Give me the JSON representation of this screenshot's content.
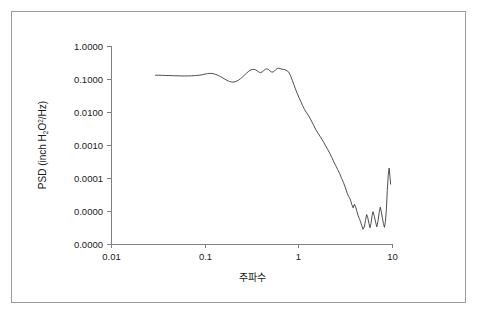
{
  "figure": {
    "background_color": "#ffffff",
    "border_color": "#9a9a9a"
  },
  "chart_data": {
    "type": "line",
    "title": "",
    "xlabel": "주파수",
    "ylabel": "PSD (inch H2O2/Hz)",
    "ylabel_parts": {
      "prefix": "PSD (inch H",
      "sub": "2",
      "mid": "O",
      "sup": "2",
      "suffix": "/Hz)"
    },
    "xscale": "log",
    "yscale": "log",
    "xlim": [
      0.01,
      10
    ],
    "ylim": [
      1e-06,
      1.0
    ],
    "grid": false,
    "legend": null,
    "xtick_labels": [
      "0.01",
      "0.1",
      "1",
      "10"
    ],
    "xtick_values": [
      0.01,
      0.1,
      1,
      10
    ],
    "ytick_labels": [
      "1.0000",
      "0.1000",
      "0.0100",
      "0.0010",
      "0.0001",
      "0.0000",
      "0.0000"
    ],
    "ytick_values": [
      1.0,
      0.1,
      0.01,
      0.001,
      0.0001,
      1e-05,
      1e-06
    ],
    "line_color": "#3b3b3b",
    "series": [
      {
        "name": "PSD",
        "x": [
          0.0295,
          0.032,
          0.035,
          0.038,
          0.042,
          0.046,
          0.05,
          0.055,
          0.06,
          0.066,
          0.072,
          0.079,
          0.086,
          0.094,
          0.1,
          0.106,
          0.112,
          0.118,
          0.124,
          0.13,
          0.138,
          0.146,
          0.154,
          0.163,
          0.172,
          0.182,
          0.192,
          0.203,
          0.214,
          0.226,
          0.238,
          0.25,
          0.262,
          0.275,
          0.288,
          0.3,
          0.315,
          0.33,
          0.345,
          0.36,
          0.375,
          0.39,
          0.405,
          0.42,
          0.437,
          0.455,
          0.472,
          0.49,
          0.51,
          0.53,
          0.55,
          0.57,
          0.59,
          0.61,
          0.63,
          0.655,
          0.68,
          0.705,
          0.73,
          0.76,
          0.79,
          0.82,
          0.85,
          0.885,
          0.92,
          0.96,
          1.0,
          1.05,
          1.1,
          1.15,
          1.2,
          1.26,
          1.32,
          1.38,
          1.45,
          1.52,
          1.6,
          1.68,
          1.76,
          1.85,
          1.94,
          2.04,
          2.14,
          2.25,
          2.36,
          2.48,
          2.6,
          2.73,
          2.86,
          3.0,
          3.1,
          3.2,
          3.3,
          3.42,
          3.55,
          3.68,
          3.8,
          3.92,
          4.05,
          4.18,
          4.3,
          4.42,
          4.55,
          4.7,
          4.85,
          5.0,
          5.15,
          5.3,
          5.45,
          5.6,
          5.75,
          5.9,
          6.05,
          6.2,
          6.4,
          6.6,
          6.8,
          7.0,
          7.2,
          7.4,
          7.6,
          7.8,
          8.0,
          8.2,
          8.4,
          8.6,
          8.8,
          9.0,
          9.2,
          9.4,
          9.55
        ],
        "y": [
          0.13,
          0.13,
          0.129,
          0.128,
          0.127,
          0.126,
          0.125,
          0.124,
          0.124,
          0.124,
          0.125,
          0.127,
          0.13,
          0.135,
          0.141,
          0.146,
          0.148,
          0.147,
          0.143,
          0.137,
          0.128,
          0.118,
          0.108,
          0.098,
          0.09,
          0.084,
          0.081,
          0.081,
          0.085,
          0.092,
          0.102,
          0.115,
          0.13,
          0.148,
          0.166,
          0.182,
          0.192,
          0.196,
          0.19,
          0.176,
          0.162,
          0.156,
          0.162,
          0.178,
          0.196,
          0.204,
          0.196,
          0.178,
          0.164,
          0.162,
          0.174,
          0.194,
          0.208,
          0.212,
          0.208,
          0.2,
          0.196,
          0.192,
          0.186,
          0.174,
          0.152,
          0.122,
          0.092,
          0.068,
          0.05,
          0.037,
          0.028,
          0.021,
          0.0155,
          0.012,
          0.0098,
          0.008,
          0.0064,
          0.005,
          0.0038,
          0.0029,
          0.0023,
          0.00185,
          0.0015,
          0.00118,
          0.00092,
          0.00072,
          0.00056,
          0.00042,
          0.00031,
          0.000235,
          0.00018,
          0.000135,
          9.8e-05,
          7.2e-05,
          5.6e-05,
          4.3e-05,
          3.3e-05,
          2.7e-05,
          2.2e-05,
          1.55e-05,
          1.25e-05,
          1.6e-05,
          1.3e-05,
          9.5e-06,
          7.2e-06,
          6e-06,
          4.8e-06,
          3.6e-06,
          2.8e-06,
          3.3e-06,
          5.2e-06,
          7.8e-06,
          6.2e-06,
          4.2e-06,
          3.1e-06,
          4.2e-06,
          7.2e-06,
          9.5e-06,
          6.8e-06,
          4.6e-06,
          3.3e-06,
          5e-06,
          8.8e-06,
          1.3e-05,
          9.5e-06,
          6.2e-06,
          4.2e-06,
          3.2e-06,
          4.8e-06,
          1.1e-05,
          4.2e-05,
          0.00012,
          0.0002,
          0.00011,
          6.5e-05
        ]
      }
    ],
    "annotations": []
  }
}
